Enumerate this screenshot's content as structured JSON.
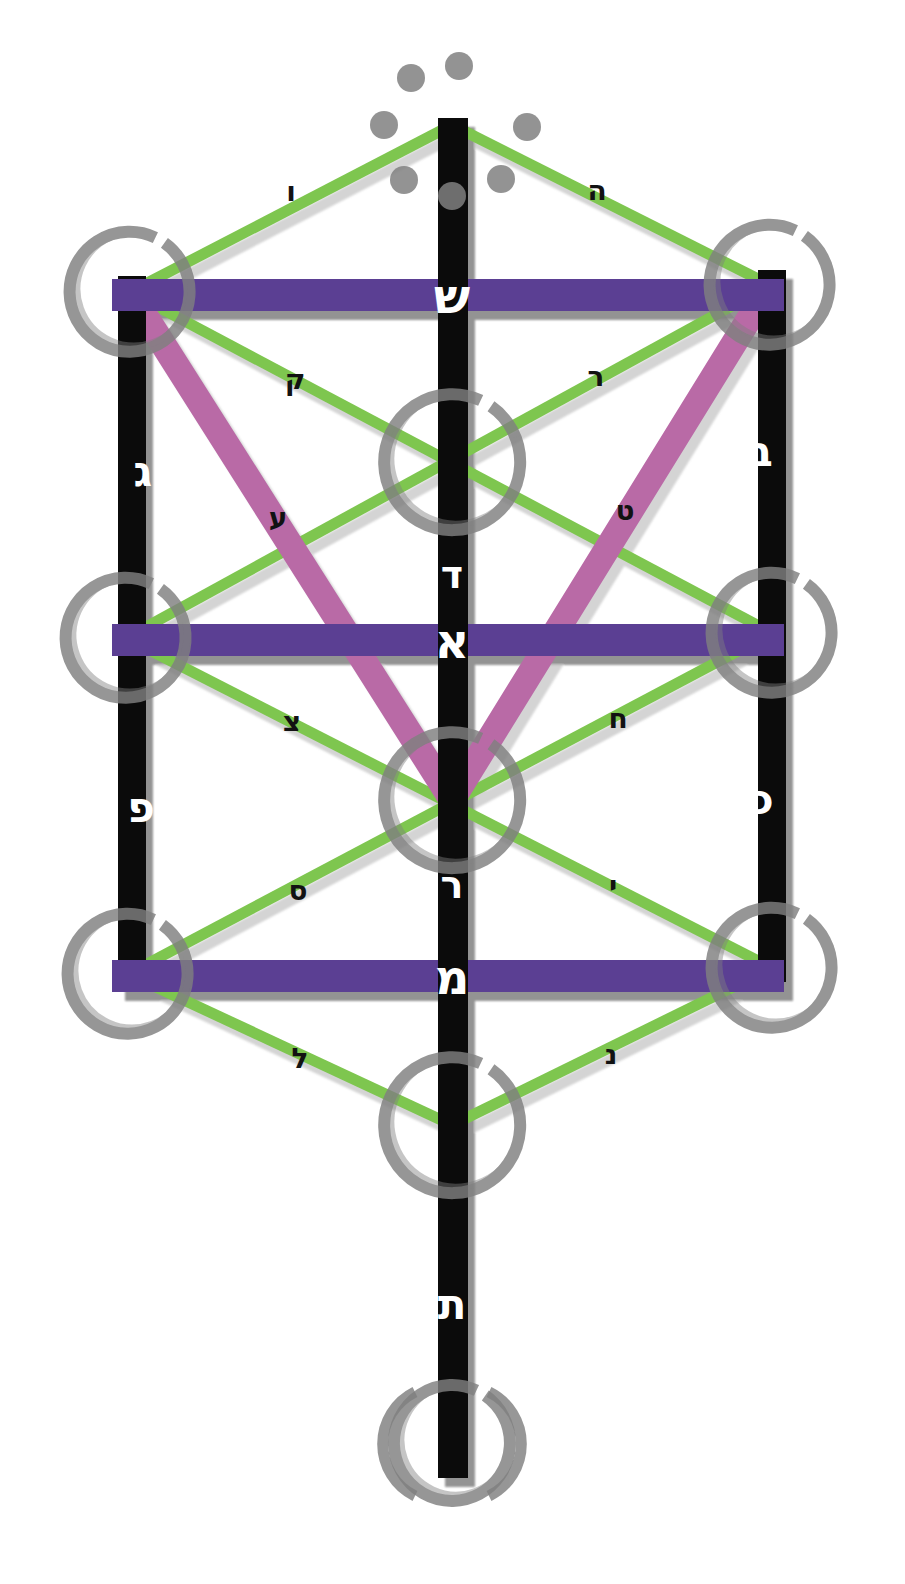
{
  "diagram": {
    "type": "tree-of-life",
    "background_color": "#ffffff",
    "colors": {
      "pillar": "#0b0b0b",
      "horizontal_bar": "#5b3f93",
      "diagonal_green": "#7ec64f",
      "diagonal_magenta": "#b96aa6",
      "circle_ring": "#808080",
      "shadow": "#b3b3b3",
      "letter_on_dark": "#ffffff",
      "letter_on_light": "#121212"
    }
  },
  "mother_letters": [
    {
      "id": "shin",
      "glyph": "ש",
      "name": "Shin",
      "on": "top-horizontal-bar",
      "color": "#ffffff",
      "x": 452,
      "y": 296,
      "size": 48
    },
    {
      "id": "aleph",
      "glyph": "א",
      "name": "Aleph",
      "on": "middle-horizontal-bar",
      "color": "#ffffff",
      "x": 452,
      "y": 641,
      "size": 48
    },
    {
      "id": "mem",
      "glyph": "מ",
      "name": "Mem",
      "on": "bottom-horizontal-bar",
      "color": "#ffffff",
      "x": 452,
      "y": 977,
      "size": 48
    }
  ],
  "double_letters": [
    {
      "id": "bet",
      "glyph": "ב",
      "name": "Bet",
      "on": "right-pillar-upper",
      "color": "#ffffff",
      "x": 760,
      "y": 452,
      "size": 42
    },
    {
      "id": "gimel",
      "glyph": "ג",
      "name": "Gimel",
      "on": "left-pillar-upper",
      "color": "#ffffff",
      "x": 143,
      "y": 472,
      "size": 42
    },
    {
      "id": "dalet",
      "glyph": "ד",
      "name": "Dalet",
      "on": "center-pillar-upper",
      "color": "#ffffff",
      "x": 452,
      "y": 575,
      "size": 38
    },
    {
      "id": "kaf",
      "glyph": "כ",
      "name": "Kaf",
      "on": "right-pillar-lower",
      "color": "#ffffff",
      "x": 762,
      "y": 800,
      "size": 42
    },
    {
      "id": "pe",
      "glyph": "פ",
      "name": "Pe",
      "on": "left-pillar-lower",
      "color": "#ffffff",
      "x": 141,
      "y": 808,
      "size": 42
    },
    {
      "id": "resh",
      "glyph": "ר",
      "name": "Resh",
      "on": "center-pillar-lower",
      "color": "#ffffff",
      "x": 452,
      "y": 885,
      "size": 38
    },
    {
      "id": "tav",
      "glyph": "ת",
      "name": "Tav",
      "on": "center-pillar-foot",
      "color": "#ffffff",
      "x": 452,
      "y": 1305,
      "size": 42
    }
  ],
  "single_letters": [
    {
      "id": "vav",
      "glyph": "ו",
      "name": "Vav",
      "on": "green-diagonal-top-left",
      "color": "#121212",
      "x": 291,
      "y": 192,
      "size": 28
    },
    {
      "id": "hey",
      "glyph": "ה",
      "name": "Hey",
      "on": "green-diagonal-top-right",
      "color": "#121212",
      "x": 597,
      "y": 191,
      "size": 28
    },
    {
      "id": "qof",
      "glyph": "ק",
      "name": "Qof",
      "on": "green-diagonal-upper-left",
      "color": "#121212",
      "x": 295,
      "y": 380,
      "size": 28
    },
    {
      "id": "resh2",
      "glyph": "ר",
      "name": "Resh",
      "on": "green-diagonal-upper-right",
      "color": "#121212",
      "x": 596,
      "y": 377,
      "size": 28
    },
    {
      "id": "ayin",
      "glyph": "ע",
      "name": "Ayin",
      "on": "magenta-band-left",
      "color": "#121212",
      "x": 278,
      "y": 518,
      "size": 28
    },
    {
      "id": "tet",
      "glyph": "ט",
      "name": "Tet",
      "on": "magenta-band-right",
      "color": "#121212",
      "x": 625,
      "y": 511,
      "size": 28
    },
    {
      "id": "tsadi",
      "glyph": "צ",
      "name": "Tsadi",
      "on": "green-diagonal-mid-left",
      "color": "#121212",
      "x": 292,
      "y": 722,
      "size": 28
    },
    {
      "id": "chet",
      "glyph": "ח",
      "name": "Chet",
      "on": "green-diagonal-mid-right",
      "color": "#121212",
      "x": 618,
      "y": 719,
      "size": 28
    },
    {
      "id": "samekh",
      "glyph": "ס",
      "name": "Samekh",
      "on": "green-diagonal-lower-left",
      "color": "#121212",
      "x": 298,
      "y": 891,
      "size": 28
    },
    {
      "id": "yod",
      "glyph": "י",
      "name": "Yod",
      "on": "green-diagonal-lower-right",
      "color": "#121212",
      "x": 613,
      "y": 886,
      "size": 28
    },
    {
      "id": "lamed",
      "glyph": "ל",
      "name": "Lamed",
      "on": "green-diagonal-bottom-left",
      "color": "#121212",
      "x": 300,
      "y": 1059,
      "size": 28
    },
    {
      "id": "nun",
      "glyph": "נ",
      "name": "Nun",
      "on": "green-diagonal-bottom-right",
      "color": "#121212",
      "x": 611,
      "y": 1055,
      "size": 28
    }
  ],
  "sephirot_circles": [
    {
      "id": "circle-top-left",
      "cx": 130,
      "cy": 292,
      "r": 60
    },
    {
      "id": "circle-top-right",
      "cx": 770,
      "cy": 285,
      "r": 60
    },
    {
      "id": "circle-center-upper",
      "cx": 452,
      "cy": 462,
      "r": 68
    },
    {
      "id": "circle-mid-left",
      "cx": 126,
      "cy": 638,
      "r": 60
    },
    {
      "id": "circle-mid-right",
      "cx": 772,
      "cy": 633,
      "r": 60
    },
    {
      "id": "circle-center-lower",
      "cx": 452,
      "cy": 800,
      "r": 68
    },
    {
      "id": "circle-low-left",
      "cx": 128,
      "cy": 974,
      "r": 60
    },
    {
      "id": "circle-low-right",
      "cx": 772,
      "cy": 968,
      "r": 60
    },
    {
      "id": "circle-malkuth",
      "cx": 452,
      "cy": 1125,
      "r": 68
    },
    {
      "id": "circle-foot",
      "cx": 452,
      "cy": 1443,
      "r": 58
    }
  ],
  "crown_dots": [
    {
      "id": "dot-1",
      "cx": 459,
      "cy": 66,
      "r": 14
    },
    {
      "id": "dot-2",
      "cx": 411,
      "cy": 78,
      "r": 14
    },
    {
      "id": "dot-3",
      "cx": 384,
      "cy": 125,
      "r": 14
    },
    {
      "id": "dot-4",
      "cx": 527,
      "cy": 127,
      "r": 14
    },
    {
      "id": "dot-5",
      "cx": 404,
      "cy": 180,
      "r": 14
    },
    {
      "id": "dot-6",
      "cx": 501,
      "cy": 179,
      "r": 14
    },
    {
      "id": "dot-7",
      "cx": 452,
      "cy": 196,
      "r": 14
    }
  ]
}
